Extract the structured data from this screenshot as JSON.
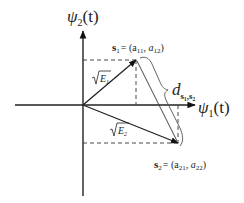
{
  "diagram": {
    "type": "signal-space constellation",
    "axes": {
      "vertical": {
        "symbol": "ψ",
        "subscript": "2",
        "arg": "(t)"
      },
      "horizontal": {
        "symbol": "ψ",
        "subscript": "1",
        "arg": "(t)"
      }
    },
    "points": [
      {
        "name": "s1",
        "vector": "s",
        "sub": "1",
        "coords_text": "= (a",
        "c1sub": "11",
        "c2sub": "12",
        "energy_label": "E",
        "energy_sub": "1"
      },
      {
        "name": "s2",
        "vector": "s",
        "sub": "2",
        "coords_text": "= (a",
        "c1sub": "21",
        "c2sub": "22",
        "energy_label": "E",
        "energy_sub": "2"
      }
    ],
    "distance": {
      "symbol": "d",
      "sub": "s₁,s₂"
    },
    "colors": {
      "line": "#222222",
      "dashed": "#333333",
      "brace": "#555555"
    }
  }
}
